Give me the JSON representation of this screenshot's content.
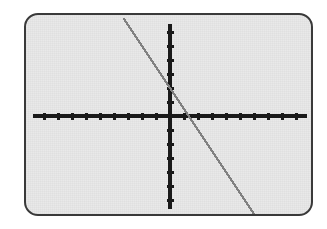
{
  "device": {
    "type": "graphing-calculator-screen",
    "screen_bg_color": "#e9e9e9",
    "bezel_color": "#3a3a3a",
    "page_bg_color": "#ffffff"
  },
  "chart_data": {
    "type": "line",
    "title": "",
    "subtitle": "",
    "xlabel": "",
    "ylabel": "",
    "axis_color": "#1a1a1a",
    "line_color": "#808080",
    "grid": false,
    "legend": null,
    "annotations": [],
    "xlim": [
      -10,
      10
    ],
    "ylim": [
      -10,
      10
    ],
    "xticks": [
      -10,
      -9,
      -8,
      -7,
      -6,
      -5,
      -4,
      -3,
      -2,
      -1,
      1,
      2,
      3,
      4,
      5,
      6,
      7,
      8,
      9,
      10
    ],
    "yticks": [
      -10,
      -9,
      -8,
      -7,
      -6,
      -5,
      -4,
      -3,
      -2,
      -1,
      1,
      2,
      3,
      4,
      5,
      6,
      7,
      8,
      9,
      10
    ],
    "xtick_labels": [],
    "ytick_labels": [],
    "tick_interval": 1,
    "series": [
      {
        "name": "y = -1.5x + 2",
        "color": "#808080",
        "slope": -1.5,
        "intercept": 2,
        "x_intercept": 1.33,
        "y_intercept": 2,
        "x": [
          -3.3,
          -2,
          -1,
          0,
          1,
          1.33,
          2,
          3,
          4,
          5,
          6.4
        ],
        "y": [
          6.95,
          5.0,
          3.5,
          2.0,
          0.5,
          0.0,
          -1.0,
          -2.5,
          -4.0,
          -5.5,
          -7.6
        ]
      }
    ]
  },
  "geometry": {
    "screen_width": 289,
    "screen_height": 203,
    "origin_x": 144,
    "origin_y": 101,
    "unit_px": 14,
    "x_axis_start": 7,
    "x_axis_end": 281,
    "y_axis_start": 9,
    "y_axis_end": 194,
    "tick_len": 7,
    "axis_thickness": 4,
    "line_thickness": 2.3,
    "line_x1": 98,
    "line_y1": 12,
    "line_x2": 234,
    "line_y2": 195
  }
}
